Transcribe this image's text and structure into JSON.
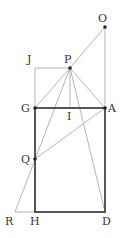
{
  "diagram": {
    "points": {
      "O": {
        "label": "O",
        "x": 105,
        "y": 27,
        "lx": 98,
        "ly": 22
      },
      "P": {
        "label": "P",
        "x": 70,
        "y": 68,
        "lx": 64,
        "ly": 63
      },
      "J": {
        "label": "J",
        "x": 35,
        "y": 68,
        "lx": 27,
        "ly": 63
      },
      "G": {
        "label": "G",
        "x": 35,
        "y": 108,
        "lx": 21,
        "ly": 112
      },
      "A": {
        "label": "A",
        "x": 105,
        "y": 108,
        "lx": 108,
        "ly": 112
      },
      "I": {
        "label": "I",
        "x": 70,
        "y": 108,
        "lx": 67,
        "ly": 120
      },
      "Q": {
        "label": "Q",
        "x": 35,
        "y": 159,
        "lx": 21,
        "ly": 163
      },
      "R": {
        "label": "R",
        "x": 15,
        "y": 212,
        "lx": 5,
        "ly": 225
      },
      "H": {
        "label": "H",
        "x": 35,
        "y": 212,
        "lx": 30,
        "ly": 225
      },
      "D": {
        "label": "D",
        "x": 105,
        "y": 212,
        "lx": 102,
        "ly": 225
      }
    }
  }
}
